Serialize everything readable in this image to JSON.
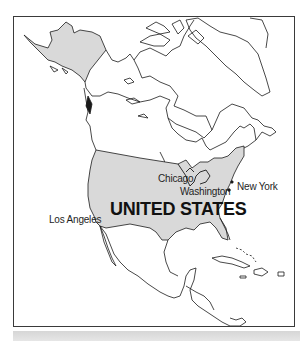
{
  "map": {
    "region": "North America",
    "highlight_color": "#d9d9d9",
    "outline_color": "#1a1a1a",
    "country_label": "UNITED STATES",
    "cities": [
      {
        "name": "Chicago"
      },
      {
        "name": "Washington"
      },
      {
        "name": "New York"
      },
      {
        "name": "Los Angeles"
      }
    ]
  }
}
